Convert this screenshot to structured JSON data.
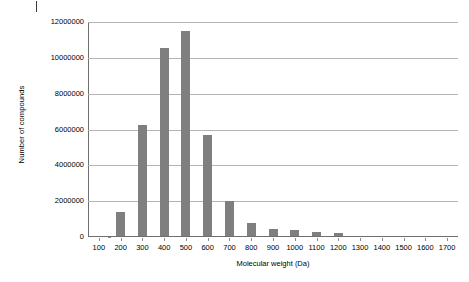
{
  "chart_data": {
    "type": "bar",
    "title": "",
    "xlabel": "Molecular weight (Da)",
    "ylabel": "Number of compounds",
    "categories": [
      "100",
      "200",
      "300",
      "400",
      "500",
      "600",
      "700",
      "800",
      "900",
      "1000",
      "1100",
      "1200",
      "1300",
      "1400",
      "1500",
      "1600",
      "1700"
    ],
    "values": [
      0,
      1350000,
      6200000,
      10500000,
      11450000,
      5650000,
      1950000,
      750000,
      380000,
      320000,
      220000,
      180000,
      0,
      0,
      0,
      0,
      0
    ],
    "ylim": [
      0,
      12000000
    ],
    "ytick_labels": [
      "0",
      "2000000",
      "4000000",
      "6000000",
      "8000000",
      "10000000",
      "12000000"
    ],
    "ytick_values": [
      0,
      2000000,
      4000000,
      6000000,
      8000000,
      10000000,
      12000000
    ],
    "grid": true,
    "legend": false,
    "bar_color": "#7f7f7f",
    "grid_color": "#b4b4b4",
    "axis_color": "#6e6e6e"
  }
}
